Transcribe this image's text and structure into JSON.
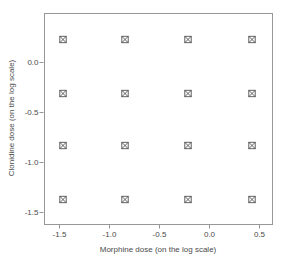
{
  "figure": {
    "background": "#ffffff",
    "box_color": "#979797",
    "tick_color": "#979797",
    "text_color": "#4a4a4a",
    "marker_color": "#515151",
    "marker_symbol": "square-with-x"
  },
  "chart_data": {
    "type": "scatter",
    "title": "",
    "xlabel": "Morphine dose (on the log scale)",
    "ylabel": "Clonidine dose (on the log scale)",
    "xlim": [
      -1.65,
      0.63
    ],
    "ylim": [
      -1.615,
      0.495
    ],
    "x_ticks": [
      -1.5,
      -1.0,
      -0.5,
      0.0,
      0.5
    ],
    "x_tick_labels": [
      "-1.5",
      "-1.0",
      "-0.5",
      "0.0",
      "0.5"
    ],
    "y_ticks": [
      0.0,
      -0.5,
      -1.0,
      -1.5
    ],
    "y_tick_labels": [
      "0.0",
      "-0.5",
      "-1.0",
      "-1.5"
    ],
    "x_levels": [
      -1.46,
      -0.84,
      -0.21,
      0.43
    ],
    "y_levels": [
      0.23,
      -0.31,
      -0.83,
      -1.37
    ],
    "grid": false,
    "legend": null,
    "points": [
      [
        -1.46,
        0.23
      ],
      [
        -0.84,
        0.23
      ],
      [
        -0.21,
        0.23
      ],
      [
        0.43,
        0.23
      ],
      [
        -1.46,
        -0.31
      ],
      [
        -0.84,
        -0.31
      ],
      [
        -0.21,
        -0.31
      ],
      [
        0.43,
        -0.31
      ],
      [
        -1.46,
        -0.83
      ],
      [
        -0.84,
        -0.83
      ],
      [
        -0.21,
        -0.83
      ],
      [
        0.43,
        -0.83
      ],
      [
        -1.46,
        -1.37
      ],
      [
        -0.84,
        -1.37
      ],
      [
        -0.21,
        -1.37
      ],
      [
        0.43,
        -1.37
      ]
    ]
  }
}
